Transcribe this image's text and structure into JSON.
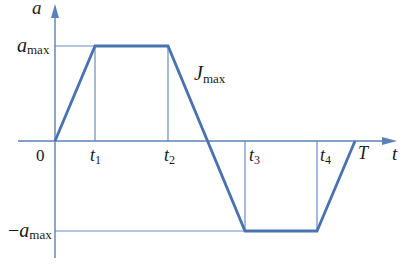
{
  "diagram": {
    "type": "acceleration-time profile (trapezoidal jerk-limited)",
    "colors": {
      "curve": "#4a72b0",
      "axis": "#5b80bb",
      "guide": "#6a8cc2",
      "text": "#1a1a1a"
    },
    "axes": {
      "y_label": "a",
      "x_label": "t",
      "origin_label": "0"
    },
    "levels": {
      "a_max": {
        "base": "a",
        "sub": "max",
        "prefix": ""
      },
      "neg_a_max": {
        "base": "a",
        "sub": "max",
        "prefix": "−"
      }
    },
    "time_marks": [
      {
        "base": "t",
        "sub": "1"
      },
      {
        "base": "t",
        "sub": "2"
      },
      {
        "base": "t",
        "sub": "3"
      },
      {
        "base": "t",
        "sub": "4"
      }
    ],
    "end_time": "T",
    "slope_label": {
      "base": "J",
      "sub": "max"
    },
    "profile_points": [
      {
        "t": "0",
        "a": "0"
      },
      {
        "t": "t1",
        "a": "a_max"
      },
      {
        "t": "t2",
        "a": "a_max"
      },
      {
        "t": "t3",
        "a": "-a_max"
      },
      {
        "t": "t4",
        "a": "-a_max"
      },
      {
        "t": "T",
        "a": "0"
      }
    ]
  }
}
